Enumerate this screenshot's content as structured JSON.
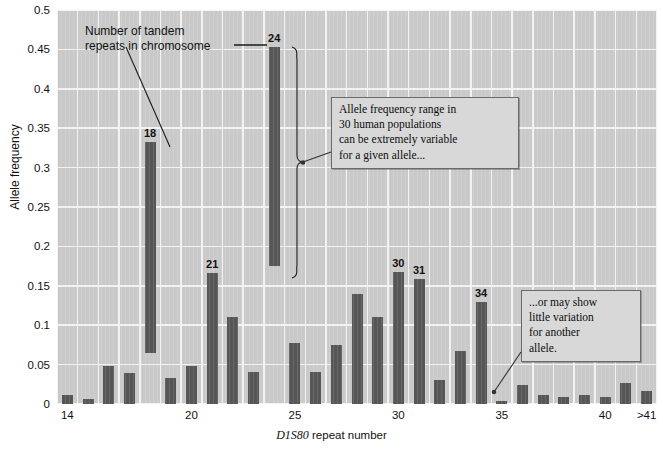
{
  "chart_data": {
    "type": "bar",
    "variant": "floating-range-bars",
    "title": "",
    "xlabel": "D1S80 repeat number",
    "xlabel_italic_part": "D1S80",
    "xlabel_rest": " repeat number",
    "ylabel": "Allele frequency",
    "ylim": [
      0,
      0.5
    ],
    "ytick_step": 0.05,
    "yticks": [
      "0",
      "0.05",
      "0.1",
      "0.15",
      "0.2",
      "0.25",
      "0.3",
      "0.35",
      "0.4",
      "0.45",
      "0.5"
    ],
    "ytick_values": [
      0,
      0.05,
      0.1,
      0.15,
      0.2,
      0.25,
      0.3,
      0.35,
      0.4,
      0.45,
      0.5
    ],
    "xticks": [
      "14",
      "20",
      "25",
      "30",
      "35",
      "40",
      ">41"
    ],
    "xtick_repeats": [
      14,
      20,
      25,
      30,
      35,
      40,
      42
    ],
    "grid": true,
    "legend": "none",
    "categories": [
      14,
      15,
      16,
      17,
      18,
      19,
      20,
      21,
      22,
      23,
      24,
      25,
      26,
      27,
      28,
      29,
      30,
      31,
      32,
      33,
      34,
      35,
      36,
      37,
      38,
      39,
      40,
      41,
      42
    ],
    "category_labels": [
      "14",
      "15",
      "16",
      "17",
      "18",
      "19",
      "20",
      "21",
      "22",
      "23",
      "24",
      "25",
      "26",
      "27",
      "28",
      "29",
      "30",
      "31",
      "32",
      "33",
      "34",
      "35",
      "36",
      "37",
      "38",
      "39",
      "40",
      "41",
      ">41"
    ],
    "series": [
      {
        "name": "Allele frequency range (low)",
        "values": [
          0.0,
          0.0,
          0.0,
          0.0,
          0.065,
          0.0,
          0.0,
          0.0,
          0.0,
          0.0,
          0.175,
          0.0,
          0.0,
          0.0,
          0.0,
          0.0,
          0.0,
          0.0,
          0.0,
          0.0,
          0.0,
          0.0,
          0.0,
          0.0,
          0.0,
          0.0,
          0.0,
          0.0,
          0.0
        ]
      },
      {
        "name": "Allele frequency range (high)",
        "values": [
          0.012,
          0.006,
          0.048,
          0.039,
          0.332,
          0.033,
          0.048,
          0.166,
          0.11,
          0.041,
          0.453,
          0.077,
          0.041,
          0.075,
          0.139,
          0.111,
          0.167,
          0.158,
          0.031,
          0.067,
          0.13,
          0.004,
          0.024,
          0.011,
          0.009,
          0.011,
          0.009,
          0.027,
          0.016
        ]
      }
    ],
    "labeled_bars": [
      {
        "category": "18",
        "label": "18",
        "high": 0.332,
        "low": 0.065
      },
      {
        "category": "21",
        "label": "21",
        "high": 0.166,
        "low": 0.0
      },
      {
        "category": "24",
        "label": "24",
        "high": 0.453,
        "low": 0.175
      },
      {
        "category": "30",
        "label": "30",
        "high": 0.167,
        "low": 0.0
      },
      {
        "category": "31",
        "label": "31",
        "high": 0.158,
        "low": 0.0
      },
      {
        "category": "34",
        "label": "34",
        "high": 0.13,
        "low": 0.0
      }
    ],
    "colors": {
      "bar": "#565656",
      "plot_background": "#c9c9c9",
      "gridline": "#f2f2f2",
      "callout_background": "#d8d8d8",
      "callout_border": "#6a6a6a",
      "text": "#111111",
      "page_background": "#ffffff"
    }
  },
  "annotations": {
    "tandem_note": {
      "line1": "Number of tandem",
      "line2": "repeats in chromosome",
      "points_to": [
        "18",
        "24"
      ]
    },
    "callout_variable": {
      "line1": "Allele frequency range in",
      "line2": "30 human populations",
      "line3": "can be extremely variable",
      "line4": "for a given allele...",
      "points_to": "24"
    },
    "callout_little": {
      "line1": "...or may show",
      "line2": "little variation",
      "line3": "for another",
      "line4": "allele.",
      "points_to": "35"
    }
  }
}
